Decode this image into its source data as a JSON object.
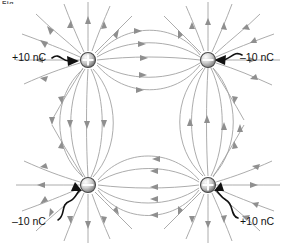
{
  "figure": {
    "title_fragment": "Fig.",
    "type": "electric-field-line-diagram"
  },
  "colors": {
    "background": "#ffffff",
    "field_line": "#a0a0a0",
    "arrow_head": "#8c8c8c",
    "leader_arrow": "#111111",
    "charge_body_light": "#f2f2f2",
    "charge_body_dark": "#8a8a8a",
    "charge_outline": "#555555",
    "label_text": "#111111"
  },
  "charges": [
    {
      "id": "charge-top-left",
      "label": "+10 nC",
      "sign": "positive",
      "glyph": "plus",
      "value_nc": 10,
      "x": 88,
      "y": 60,
      "label_x": 12,
      "label_y": 52
    },
    {
      "id": "charge-top-right",
      "label": "–10 nC",
      "sign": "negative",
      "glyph": "minus",
      "value_nc": -10,
      "x": 208,
      "y": 60,
      "label_x": 240,
      "label_y": 52
    },
    {
      "id": "charge-bottom-left",
      "label": "–10 nC",
      "sign": "negative",
      "glyph": "minus",
      "value_nc": -10,
      "x": 88,
      "y": 185,
      "label_x": 12,
      "label_y": 216
    },
    {
      "id": "charge-bottom-right",
      "label": "+10 nC",
      "sign": "positive",
      "glyph": "plus",
      "value_nc": 10,
      "x": 208,
      "y": 185,
      "label_x": 240,
      "label_y": 216
    }
  ],
  "field": {
    "top_pair_direction": "left-to-right",
    "bottom_pair_direction": "right-to-left",
    "left_pair_direction": "top-to-bottom",
    "right_pair_direction": "bottom-to-top",
    "center_region": "field cancels, no lines"
  }
}
